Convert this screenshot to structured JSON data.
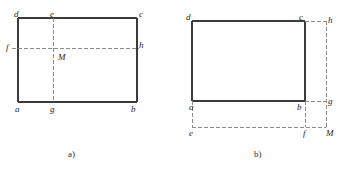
{
  "figure": {
    "background_color": "#ffffff",
    "solid_line_color": "#3c3c3c",
    "dashed_line_color": "#8c8c8c",
    "label_color": "#262626",
    "panels": [
      {
        "id": "panel-a",
        "caption": "a)",
        "caption_pos": {
          "x": 68,
          "y": 150
        },
        "rectangle": {
          "x": 18,
          "y": 18,
          "width": 119,
          "height": 84
        },
        "solid_edges": [
          {
            "name": "edge-dc-top",
            "x1": 18,
            "y1": 18,
            "x2": 137,
            "y2": 18
          },
          {
            "name": "edge-cb-right",
            "x1": 137,
            "y1": 18,
            "x2": 137,
            "y2": 102
          },
          {
            "name": "edge-ab-bottom",
            "x1": 18,
            "y1": 102,
            "x2": 137,
            "y2": 102
          },
          {
            "name": "edge-ad-left",
            "x1": 18,
            "y1": 18,
            "x2": 18,
            "y2": 102
          }
        ],
        "dashed_lines": [
          {
            "name": "dashed-eg-vertical",
            "x1": 53,
            "y1": 18,
            "x2": 53,
            "y2": 102
          },
          {
            "name": "dashed-fh-horizontal",
            "x1": 12,
            "y1": 48,
            "x2": 139,
            "y2": 48
          }
        ],
        "labels": [
          {
            "name": "label-d",
            "text": "d",
            "x": 14,
            "y": 10
          },
          {
            "name": "label-e",
            "text": "e",
            "x": 50,
            "y": 10
          },
          {
            "name": "label-c",
            "text": "c",
            "x": 139,
            "y": 10
          },
          {
            "name": "label-f",
            "text": "f",
            "x": 6,
            "y": 43
          },
          {
            "name": "label-h",
            "text": "h",
            "x": 139,
            "y": 41
          },
          {
            "name": "label-M",
            "text": "M",
            "x": 58,
            "y": 53
          },
          {
            "name": "label-a",
            "text": "a",
            "x": 15,
            "y": 105
          },
          {
            "name": "label-g",
            "text": "g",
            "x": 50,
            "y": 105
          },
          {
            "name": "label-b",
            "text": "b",
            "x": 131,
            "y": 105
          }
        ]
      },
      {
        "id": "panel-b",
        "caption": "b)",
        "caption_pos": {
          "x": 254,
          "y": 150
        },
        "rectangle": {
          "x": 192,
          "y": 21,
          "width": 113,
          "height": 80
        },
        "solid_edges": [
          {
            "name": "edge-dc-top",
            "x1": 192,
            "y1": 21,
            "x2": 305,
            "y2": 21
          },
          {
            "name": "edge-cb-right",
            "x1": 305,
            "y1": 21,
            "x2": 305,
            "y2": 101
          },
          {
            "name": "edge-ab-bottom",
            "x1": 192,
            "y1": 101,
            "x2": 305,
            "y2": 101
          },
          {
            "name": "edge-ad-left",
            "x1": 192,
            "y1": 21,
            "x2": 192,
            "y2": 101
          }
        ],
        "dashed_lines": [
          {
            "name": "dashed-ch-horizontal",
            "x1": 305,
            "y1": 21,
            "x2": 326,
            "y2": 21
          },
          {
            "name": "dashed-hM-vertical",
            "x1": 326,
            "y1": 21,
            "x2": 326,
            "y2": 127
          },
          {
            "name": "dashed-bg-horizontal",
            "x1": 305,
            "y1": 101,
            "x2": 326,
            "y2": 101
          },
          {
            "name": "dashed-ae-vertical",
            "x1": 192,
            "y1": 101,
            "x2": 192,
            "y2": 127
          },
          {
            "name": "dashed-bf-vertical",
            "x1": 305,
            "y1": 101,
            "x2": 305,
            "y2": 127
          },
          {
            "name": "dashed-efM-horizontal",
            "x1": 192,
            "y1": 127,
            "x2": 326,
            "y2": 127
          }
        ],
        "labels": [
          {
            "name": "label-d",
            "text": "d",
            "x": 186,
            "y": 13
          },
          {
            "name": "label-c",
            "text": "c",
            "x": 299,
            "y": 13
          },
          {
            "name": "label-h",
            "text": "h",
            "x": 328,
            "y": 16
          },
          {
            "name": "label-a",
            "text": "a",
            "x": 189,
            "y": 103
          },
          {
            "name": "label-b",
            "text": "b",
            "x": 297,
            "y": 103
          },
          {
            "name": "label-g",
            "text": "g",
            "x": 328,
            "y": 97
          },
          {
            "name": "label-e",
            "text": "e",
            "x": 189,
            "y": 129
          },
          {
            "name": "label-f",
            "text": "f",
            "x": 303,
            "y": 129
          },
          {
            "name": "label-M",
            "text": "M",
            "x": 326,
            "y": 129
          }
        ]
      }
    ]
  }
}
